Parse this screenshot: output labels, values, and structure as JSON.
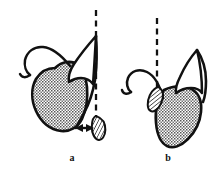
{
  "figure": {
    "title": "",
    "background_color": "#ffffff",
    "ink_color": "#111111",
    "width": 222,
    "height": 171,
    "panels": [
      {
        "id": "a",
        "label": "a",
        "label_x": 72,
        "label_y": 161,
        "description": "Anatomical line drawing: stippled tissue mass with curved outline, a vertical dashed reference line, and a hatched oval element separated from the tissue by a horizontal double-headed arrow indicating a gap.",
        "elements": {
          "dashed_reference_line": {
            "name": "vertical-dashed-reference-line",
            "x": 96,
            "y_top": 10,
            "y_bottom": 128,
            "dash_pattern": "5,4",
            "stroke_width": 2.2,
            "color": "#111111"
          },
          "stippled_mass": {
            "name": "stippled-tissue-mass",
            "fill_pattern": "stipple-dots",
            "fill_color": "#6f6f6f",
            "outline_color": "#111111"
          },
          "hatched_oval": {
            "name": "hatched-oval-element",
            "fill_pattern": "diagonal-hatch",
            "cx": 98,
            "cy": 128,
            "rx": 7,
            "ry": 12,
            "rotation": -8,
            "outline_color": "#111111"
          },
          "double_arrow": {
            "name": "double-headed-gap-arrow",
            "x_start": 78,
            "x_end": 92,
            "y": 128,
            "color": "#111111",
            "meaning": "gap / separation distance"
          }
        }
      },
      {
        "id": "b",
        "label": "b",
        "label_x": 168,
        "label_y": 161,
        "description": "Same anatomical line drawing with the hatched oval element in direct contact with the vertical dashed reference line; no gap arrow present.",
        "elements": {
          "dashed_reference_line": {
            "name": "vertical-dashed-reference-line",
            "x": 157,
            "y_top": 18,
            "y_bottom": 96,
            "dash_pattern": "5,4",
            "stroke_width": 2.2,
            "color": "#111111"
          },
          "stippled_mass": {
            "name": "stippled-tissue-mass",
            "fill_pattern": "stipple-dots",
            "fill_color": "#6f6f6f",
            "outline_color": "#111111"
          },
          "hatched_oval": {
            "name": "hatched-oval-element",
            "fill_pattern": "diagonal-hatch",
            "cx": 156,
            "cy": 99,
            "rx": 6,
            "ry": 12,
            "rotation": 16,
            "outline_color": "#111111"
          },
          "double_arrow": null
        }
      }
    ]
  }
}
